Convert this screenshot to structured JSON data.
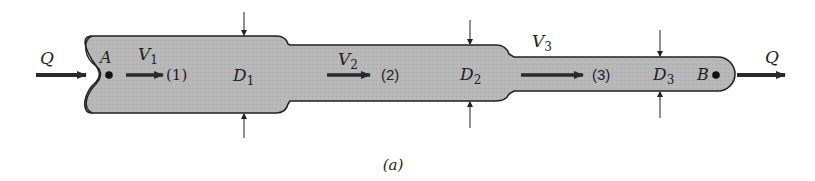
{
  "diagram": {
    "caption": "(a)",
    "flow_label_in": "Q",
    "flow_label_out": "Q",
    "points": [
      {
        "label": "A"
      },
      {
        "label": "B"
      }
    ],
    "sections": [
      {
        "velocity_symbol": "V",
        "velocity_sub": "1",
        "section_label": "(1)",
        "diameter_symbol": "D",
        "diameter_sub": "1"
      },
      {
        "velocity_symbol": "V",
        "velocity_sub": "2",
        "section_label": "(2)",
        "diameter_symbol": "D",
        "diameter_sub": "2"
      },
      {
        "velocity_symbol": "V",
        "velocity_sub": "3",
        "section_label": "(3)",
        "diameter_symbol": "D",
        "diameter_sub": "3"
      }
    ],
    "colors": {
      "pipe_fill": "#b4b4b4",
      "pipe_stroke": "#222222",
      "arrow": "#2a2a2a"
    }
  }
}
